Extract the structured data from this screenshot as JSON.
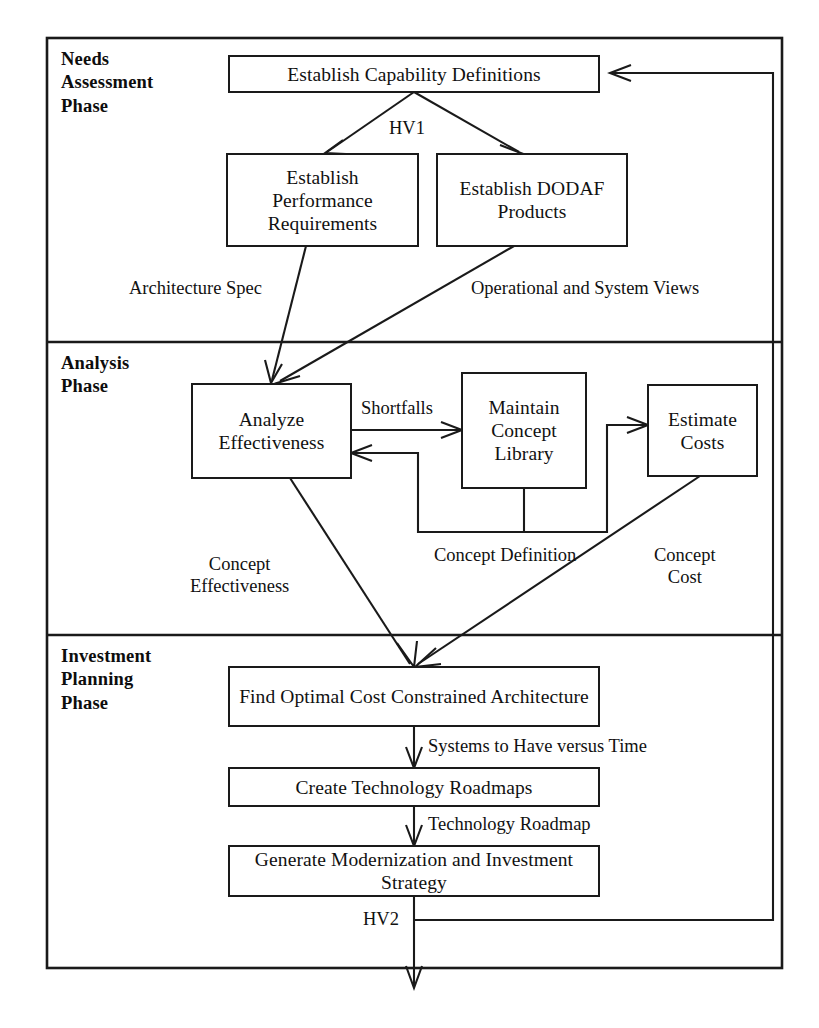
{
  "diagram": {
    "line_color": "#1a1a1a",
    "background": "#ffffff",
    "phases": [
      {
        "id": "needs",
        "label": "Needs\nAssessment\nPhase"
      },
      {
        "id": "analysis",
        "label": "Analysis\nPhase"
      },
      {
        "id": "investment",
        "label": "Investment\nPlanning\nPhase"
      }
    ],
    "nodes": [
      {
        "id": "establish-capability-definitions",
        "label": "Establish Capability Definitions"
      },
      {
        "id": "establish-performance-requirements",
        "label": "Establish\nPerformance\nRequirements"
      },
      {
        "id": "establish-dodaf-products",
        "label": "Establish\nDODAF\nProducts"
      },
      {
        "id": "analyze-effectiveness",
        "label": "Analyze\nEffectiveness"
      },
      {
        "id": "maintain-concept-library",
        "label": "Maintain\nConcept\nLibrary"
      },
      {
        "id": "estimate-costs",
        "label": "Estimate\nCosts"
      },
      {
        "id": "find-optimal-cost-constrained-architecture",
        "label": "Find Optimal Cost Constrained\nArchitecture"
      },
      {
        "id": "create-technology-roadmaps",
        "label": "Create Technology Roadmaps"
      },
      {
        "id": "generate-modernization-and-investment-strategy",
        "label": "Generate Modernization and\nInvestment Strategy"
      }
    ],
    "edge_labels": [
      {
        "id": "hv1",
        "label": "HV1"
      },
      {
        "id": "architecture-spec",
        "label": "Architecture Spec"
      },
      {
        "id": "operational-and-system-views",
        "label": "Operational and System Views"
      },
      {
        "id": "shortfalls",
        "label": "Shortfalls"
      },
      {
        "id": "concept-definition",
        "label": "Concept Definition"
      },
      {
        "id": "concept-cost",
        "label": "Concept\nCost"
      },
      {
        "id": "concept-effectiveness",
        "label": "Concept\nEffectiveness"
      },
      {
        "id": "systems-to-have-versus-time",
        "label": "Systems to Have versus Time"
      },
      {
        "id": "technology-roadmap",
        "label": "Technology Roadmap"
      },
      {
        "id": "hv2",
        "label": "HV2"
      }
    ]
  }
}
